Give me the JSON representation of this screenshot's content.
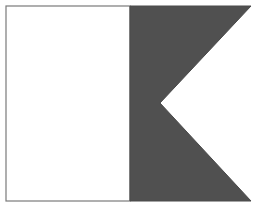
{
  "figure": {
    "colors": {
      "background": "#ffffff",
      "hoist": "#ffffff",
      "fly": "#505050",
      "border": "#7a7a7a"
    },
    "geometry": {
      "left": 6,
      "top": 6,
      "divider_x": 130,
      "right_tip_x": 251,
      "bottom": 201,
      "notch_x": 160,
      "notch_y": 103
    }
  }
}
